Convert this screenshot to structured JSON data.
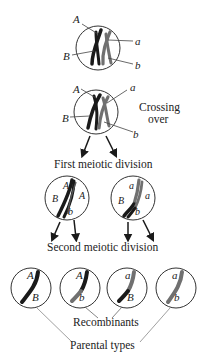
{
  "diagram": {
    "stage1": {
      "labels": {
        "A": "A",
        "B": "B",
        "a": "a",
        "b": "b"
      }
    },
    "stage2": {
      "labels": {
        "A": "A",
        "B": "B",
        "a": "a",
        "b": "b"
      },
      "caption_line1": "Crossing",
      "caption_line2": "over"
    },
    "first_division": {
      "caption": "First meiotic division",
      "left": {
        "top": "A",
        "left": "B",
        "right": "A",
        "bottom": "b"
      },
      "right": {
        "top": "a",
        "left": "B",
        "right": "a",
        "bottom": "b"
      }
    },
    "second_division": {
      "caption": "Second meiotic division",
      "gametes": [
        {
          "top": "A",
          "bottom": "B",
          "type": "parental"
        },
        {
          "top": "A",
          "bottom": "b",
          "type": "recombinant"
        },
        {
          "top": "a",
          "bottom": "B",
          "type": "recombinant"
        },
        {
          "top": "a",
          "bottom": "b",
          "type": "parental"
        }
      ]
    },
    "recombinants_label": "Recombinants",
    "parental_label": "Parental types",
    "colors": {
      "dark": "#1a1a1a",
      "gray": "#6e6e6e",
      "line": "#444444"
    }
  }
}
